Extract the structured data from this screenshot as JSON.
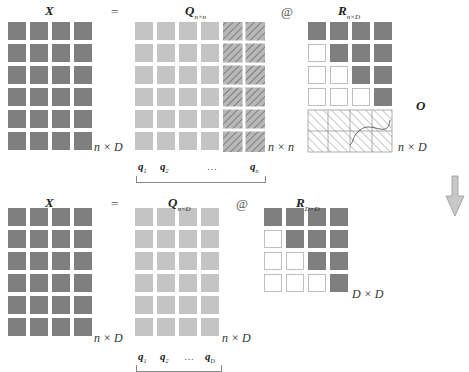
{
  "colors": {
    "dark_cell": "#7f7f7f",
    "light_cell": "#c4c4c4",
    "empty_cell_border": "#b0b0b0",
    "hatch_fill": "#b8b8b8",
    "hatch_line": "#555555",
    "arrow_fill": "#c8c8c8",
    "arrow_stroke": "#999999"
  },
  "top": {
    "x_label": "X",
    "eq": "=",
    "q_label": "Q",
    "q_sub": "n×n",
    "at": "@",
    "r_label": "R",
    "r_sub": "n×D",
    "x_dim": "n × D",
    "q_dim": "n × n",
    "r_dim": "n × D",
    "o_label": "O",
    "q_cols": [
      {
        "name": "q",
        "sub": "1"
      },
      {
        "name": "q",
        "sub": "2"
      },
      {
        "name": "…",
        "sub": ""
      },
      {
        "name": "q",
        "sub": "n"
      }
    ]
  },
  "bottom": {
    "x_label": "X",
    "eq": "=",
    "q_label": "Q",
    "q_sub": "n×D",
    "at": "@",
    "r_label": "R",
    "r_sub": "D×D",
    "x_dim": "n × D",
    "q_dim": "n × D",
    "r_dim": "D × D",
    "q_cols": [
      {
        "name": "q",
        "sub": "1"
      },
      {
        "name": "q",
        "sub": "2"
      },
      {
        "name": "…",
        "sub": ""
      },
      {
        "name": "q",
        "sub": "D"
      }
    ]
  },
  "arrow": {
    "direction": "down"
  }
}
